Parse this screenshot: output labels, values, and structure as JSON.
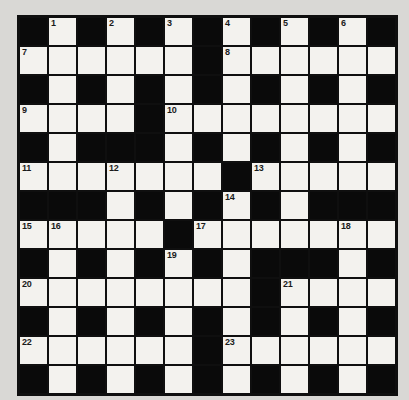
{
  "page": {
    "background_color": "#d9d8d5"
  },
  "crossword": {
    "title": "crossword-puzzle-grid",
    "rows": 13,
    "cols": 13,
    "colors": {
      "black_cell": "#0a0a0a",
      "white_cell": "#f3f2ee",
      "grid_line": "#0f0f0f",
      "number_text": "#1a1a1a"
    },
    "grid": [
      "BWBWBWBWBWBWB",
      "WWWWWWBWWWWWW",
      "BWBWBWBWBWBWB",
      "WWWWBWWWWWWWW",
      "BWBBBWBWBWBWB",
      "WWWWWWWBWWWWW",
      "BBBWBWBWBWBBB",
      "WWWWWBWWWWWWW",
      "BWBWBWBWBBBWB",
      "WWWWWWWWBWWWW",
      "BWBWBWBWBWBWB",
      "WWWWWWBWWWWWW",
      "BWBWBWBWBWBWB"
    ],
    "numbers": [
      {
        "row": 0,
        "col": 1,
        "label": "1"
      },
      {
        "row": 0,
        "col": 3,
        "label": "2"
      },
      {
        "row": 0,
        "col": 5,
        "label": "3"
      },
      {
        "row": 0,
        "col": 7,
        "label": "4"
      },
      {
        "row": 0,
        "col": 9,
        "label": "5"
      },
      {
        "row": 0,
        "col": 11,
        "label": "6"
      },
      {
        "row": 1,
        "col": 0,
        "label": "7"
      },
      {
        "row": 1,
        "col": 7,
        "label": "8"
      },
      {
        "row": 3,
        "col": 0,
        "label": "9"
      },
      {
        "row": 3,
        "col": 5,
        "label": "10"
      },
      {
        "row": 5,
        "col": 0,
        "label": "11"
      },
      {
        "row": 5,
        "col": 3,
        "label": "12"
      },
      {
        "row": 5,
        "col": 8,
        "label": "13"
      },
      {
        "row": 6,
        "col": 7,
        "label": "14"
      },
      {
        "row": 7,
        "col": 0,
        "label": "15"
      },
      {
        "row": 7,
        "col": 1,
        "label": "16"
      },
      {
        "row": 7,
        "col": 6,
        "label": "17"
      },
      {
        "row": 7,
        "col": 11,
        "label": "18"
      },
      {
        "row": 8,
        "col": 5,
        "label": "19"
      },
      {
        "row": 9,
        "col": 0,
        "label": "20"
      },
      {
        "row": 9,
        "col": 9,
        "label": "21"
      },
      {
        "row": 11,
        "col": 0,
        "label": "22"
      },
      {
        "row": 11,
        "col": 7,
        "label": "23"
      }
    ]
  }
}
